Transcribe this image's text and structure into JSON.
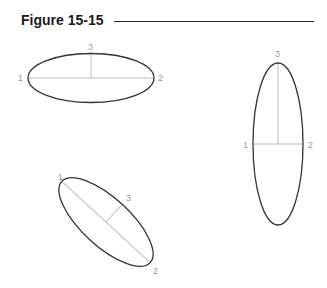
{
  "figure": {
    "title": "Figure 15-15"
  },
  "ellipses": [
    {
      "name": "horizontal",
      "center": [
        91,
        78
      ],
      "rx": 63,
      "ry": 24.5,
      "rotation": 0,
      "labels": {
        "p1": "1",
        "p2": "2",
        "p3": "3"
      }
    },
    {
      "name": "vertical",
      "center": [
        278,
        144
      ],
      "rx": 25,
      "ry": 81,
      "rotation": 0,
      "labels": {
        "p1": "1",
        "p2": "2",
        "p3": "3"
      }
    },
    {
      "name": "diagonal",
      "center": [
        106,
        222
      ],
      "rx": 60,
      "ry": 24,
      "rotation": 42.6,
      "labels": {
        "p1": "1",
        "p2": "2",
        "p3": "3"
      }
    }
  ],
  "colors": {
    "outline": "#333333",
    "axis": "#bdbdbd",
    "label": "#9a9a9a"
  }
}
